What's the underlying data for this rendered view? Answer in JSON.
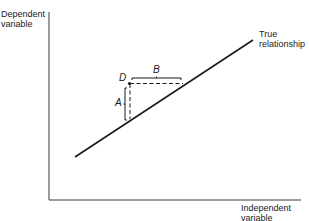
{
  "diagram": {
    "y_axis_label": [
      "Dependent",
      "variable"
    ],
    "x_axis_label": [
      "Independent",
      "variable"
    ],
    "line_label": [
      "True",
      "relationship"
    ],
    "point_label": "D",
    "horizontal_gap_label": "B",
    "vertical_gap_label": "A",
    "colors": {
      "line": "#1a1a1a",
      "background": "#ffffff"
    }
  }
}
